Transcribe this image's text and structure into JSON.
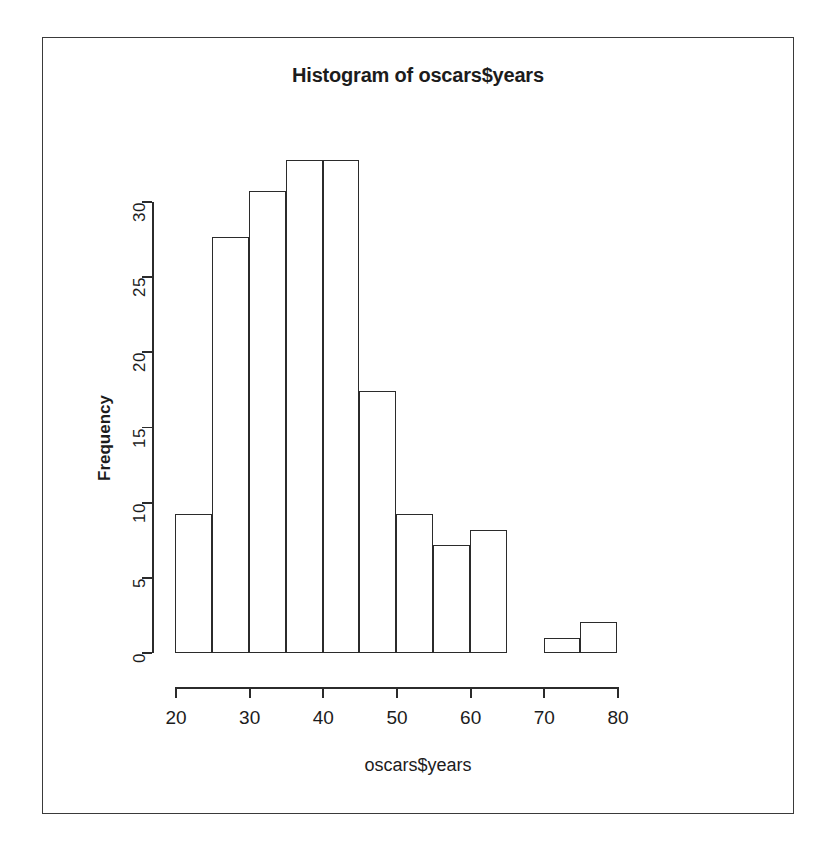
{
  "chart_data": {
    "type": "bar",
    "title": "Histogram of oscars$years",
    "xlabel": "oscars$years",
    "ylabel": "Frequency",
    "grid": false,
    "legend": "none",
    "xlim": [
      20,
      80
    ],
    "ylim": [
      0,
      32
    ],
    "bin_width": 5,
    "bin_edges": [
      20,
      25,
      30,
      35,
      40,
      45,
      50,
      55,
      60,
      65,
      70,
      75,
      80
    ],
    "categories": [
      "20-25",
      "25-30",
      "30-35",
      "35-40",
      "40-45",
      "45-50",
      "50-55",
      "55-60",
      "60-65",
      "65-70",
      "70-75",
      "75-80"
    ],
    "values": [
      9,
      27,
      30,
      32,
      32,
      17,
      9,
      7,
      8,
      0,
      1,
      2
    ],
    "x_ticks": [
      20,
      30,
      40,
      50,
      60,
      70,
      80
    ],
    "x_tick_labels": [
      "20",
      "30",
      "40",
      "50",
      "60",
      "70",
      "80"
    ],
    "y_ticks": [
      0,
      5,
      10,
      15,
      20,
      25,
      30
    ],
    "y_tick_labels": [
      "0",
      "5",
      "10",
      "15",
      "20",
      "25",
      "30"
    ],
    "bar_fill_color": "#ffffff",
    "bar_border_color": "#2b2b2b",
    "axis_color": "#2b2b2b",
    "background_color": "#ffffff",
    "frame_color": "#3a3a3a"
  }
}
